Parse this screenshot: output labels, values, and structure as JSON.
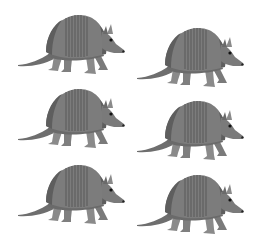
{
  "image": {
    "subject": "armadillo",
    "count": 6,
    "layout": "2 columns x 3 rows",
    "background": "#ffffff",
    "colors": {
      "shell": "#7c7c7c",
      "shell_dark": "#5e5e5e",
      "band_line": "#555555",
      "body": "#6a6a6a",
      "legs": "#8a8a8a",
      "eye": "#111111"
    },
    "items": [
      {
        "id": "armadillo-1",
        "row": 1,
        "col": 1,
        "x": 16,
        "y": 12
      },
      {
        "id": "armadillo-2",
        "row": 1,
        "col": 2,
        "x": 135,
        "y": 25
      },
      {
        "id": "armadillo-3",
        "row": 2,
        "col": 1,
        "x": 16,
        "y": 86
      },
      {
        "id": "armadillo-4",
        "row": 2,
        "col": 2,
        "x": 135,
        "y": 98
      },
      {
        "id": "armadillo-5",
        "row": 3,
        "col": 1,
        "x": 16,
        "y": 162
      },
      {
        "id": "armadillo-6",
        "row": 3,
        "col": 2,
        "x": 135,
        "y": 172
      }
    ]
  }
}
